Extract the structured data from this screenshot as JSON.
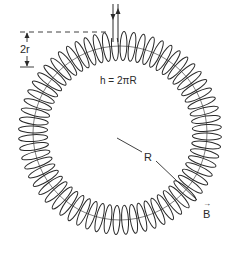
{
  "diagram": {
    "labels": {
      "diameter": "2r",
      "length": "h = 2πR",
      "radius": "R",
      "field": "B",
      "field_vector_mark": "→"
    },
    "geometry": {
      "center": [
        120,
        133
      ],
      "outer_radius": 100,
      "inner_radius": 74,
      "turns": 64
    },
    "colors": {
      "ink": "#2a2a2a",
      "background": "#ffffff"
    }
  }
}
